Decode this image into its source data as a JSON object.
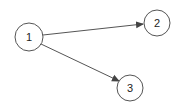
{
  "diagram": {
    "type": "directed-graph",
    "nodes": [
      {
        "id": "1",
        "label": "1",
        "cx": 29,
        "cy": 37,
        "r": 14
      },
      {
        "id": "2",
        "label": "2",
        "cx": 157,
        "cy": 23,
        "r": 13
      },
      {
        "id": "3",
        "label": "3",
        "cx": 130,
        "cy": 88,
        "r": 13
      }
    ],
    "edges": [
      {
        "from": "1",
        "to": "2"
      },
      {
        "from": "1",
        "to": "3"
      }
    ],
    "colors": {
      "stroke": "#555555",
      "node_fill": "#ffffff",
      "background": "#ffffff"
    }
  }
}
